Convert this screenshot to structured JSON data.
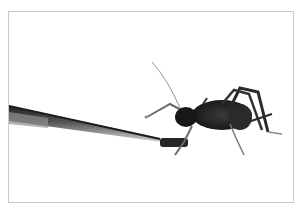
{
  "image": {
    "description": "Black-and-white photo of a cricket (weta-like insect) being fed with metal tweezers on a white background",
    "subjects": [
      "cricket",
      "tweezers"
    ],
    "frame": {
      "border_color": "#c8c8c8",
      "background": "#ffffff"
    },
    "colors": {
      "insect": "#1c1c1c",
      "tweezers_dark": "#2a2a2a",
      "tweezers_light": "#9a9a9a",
      "legs": "#6a6a6a"
    }
  }
}
